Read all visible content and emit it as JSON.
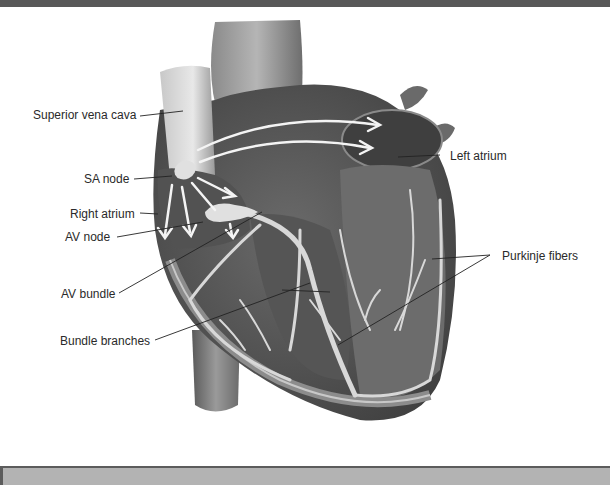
{
  "diagram": {
    "labels": [
      {
        "id": "superior-vena-cava",
        "text": "Superior vena cava"
      },
      {
        "id": "sa-node",
        "text": "SA node"
      },
      {
        "id": "right-atrium",
        "text": "Right atrium"
      },
      {
        "id": "av-node",
        "text": "AV node"
      },
      {
        "id": "av-bundle",
        "text": "AV bundle"
      },
      {
        "id": "bundle-branches",
        "text": "Bundle branches"
      },
      {
        "id": "left-atrium",
        "text": "Left atrium"
      },
      {
        "id": "purkinje-fibers",
        "text": "Purkinje fibers"
      }
    ]
  },
  "colors": {
    "top_bar": "#585858",
    "caption_bar": "#b3b3b3",
    "label_text": "#2a2a2a",
    "heart_dark": "#4a4a4a",
    "heart_mid": "#7a7a7a",
    "heart_light": "#a8a8a8",
    "fibers": "#d8d8d8"
  }
}
